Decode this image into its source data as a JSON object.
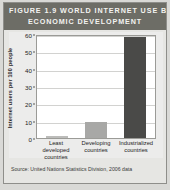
{
  "figure": {
    "title_lines": [
      "FIGURE 1.9 WORLD INTERNET USE BY",
      "ECONOMIC DEVELOPMENT"
    ],
    "source": "Source: United Nations Statistics Division, 2006 data"
  },
  "colors": {
    "banner": "#6d6d66",
    "banner_text": "#f3f3f0",
    "page": "#e6e6e3",
    "plot_background": "#ffffff",
    "gridline": "#d2d2d0",
    "bar_light": "#bcbcba",
    "bar_medium": "#a8a8a6",
    "bar_dark": "#4a4a48"
  },
  "chart_data": {
    "type": "bar",
    "title": "FIGURE 1.9 WORLD INTERNET USE BY ECONOMIC DEVELOPMENT",
    "categories": [
      "Least developed countries",
      "Developing countries",
      "Industrialized countries"
    ],
    "category_lines": [
      [
        "Least",
        "developed",
        "countries"
      ],
      [
        "Developing",
        "countries"
      ],
      [
        "Industrialized",
        "countries"
      ]
    ],
    "values": [
      1,
      9,
      58
    ],
    "bar_colors": [
      "#bcbcba",
      "#a8a8a6",
      "#4a4a48"
    ],
    "xlabel": "",
    "ylabel": "Internet users per 100 people",
    "ylim": [
      0,
      60
    ],
    "yticks": [
      60,
      50,
      40,
      30,
      20,
      10,
      0
    ],
    "grid": true,
    "legend": "none"
  }
}
